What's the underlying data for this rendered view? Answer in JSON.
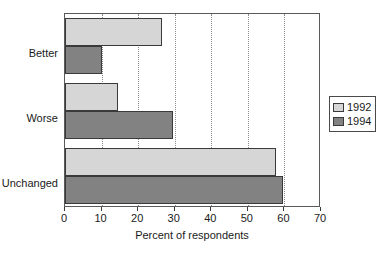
{
  "chart_data": {
    "type": "bar",
    "orientation": "horizontal",
    "title": "",
    "xlabel": "Percent of respondents",
    "ylabel": "",
    "categories": [
      "Better",
      "Worse",
      "Unchanged"
    ],
    "series": [
      {
        "name": "1992",
        "color": "#d6d6d6",
        "values": [
          26.6,
          14.6,
          57.8
        ]
      },
      {
        "name": "1994",
        "color": "#828282",
        "values": [
          10.1,
          29.6,
          59.7
        ]
      }
    ],
    "xlim": [
      0,
      70
    ],
    "xticks": [
      0,
      10,
      20,
      30,
      40,
      50,
      60,
      70
    ],
    "xtick_labels": [
      "0",
      "10",
      "20",
      "30",
      "40",
      "50",
      "60",
      "70"
    ],
    "grid": "vertical-dotted",
    "legend_position": "right"
  },
  "axis": {
    "x_title": "Percent of respondents",
    "tick_labels": [
      "0",
      "10",
      "20",
      "30",
      "40",
      "50",
      "60",
      "70"
    ],
    "category_labels": [
      "Better",
      "Worse",
      "Unchanged"
    ]
  },
  "legend": {
    "entries": [
      {
        "label": "1992"
      },
      {
        "label": "1994"
      }
    ]
  },
  "colors": {
    "series_1992": "#d6d6d6",
    "series_1994": "#828282",
    "frame": "#5a5a5a",
    "bar_outline": "#3a3a3a",
    "gridline": "#8c8c8c",
    "text": "#1a1a1a",
    "background": "#ffffff"
  }
}
